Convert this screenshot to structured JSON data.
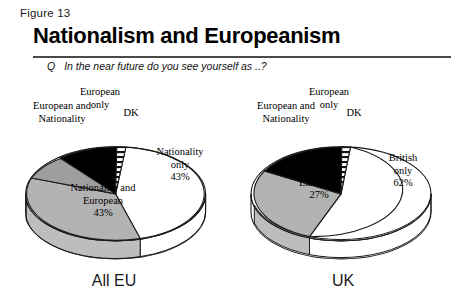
{
  "figure": {
    "label": "Figure 13",
    "title": "Nationalism and Europeanism"
  },
  "question": {
    "marker": "Q",
    "text": "In the near future do you see yourself as ..?"
  },
  "colors": {
    "slice_white": "#ffffff",
    "slice_grey": "#b3b3b3",
    "slice_black": "#000000",
    "slice_hatched": "#ffffff",
    "outline": "#1a1a1a",
    "rule": "#4a4a4a",
    "text": "#000000"
  },
  "charts": [
    {
      "id": "alleu",
      "caption": "All EU",
      "callouts": {
        "european_only": "European\nonly",
        "european_and_nationality": "European and\nNationality",
        "dk": "DK"
      },
      "slices": [
        {
          "key": "nationality_only",
          "label": "Nationality\nonly",
          "value": 43,
          "pct_text": "43%",
          "fill": "white",
          "inside_label": true
        },
        {
          "key": "nationality_and_european",
          "label": "Nationality and\nEuropean",
          "value": 43,
          "pct_text": "43%",
          "fill": "grey",
          "inside_label": true
        },
        {
          "key": "european_and_nationality",
          "label": "European and Nationality",
          "value": 7,
          "pct_text": "7%",
          "fill": "grey-dark",
          "inside_label": false
        },
        {
          "key": "european_only",
          "label": "European only",
          "value": 4,
          "pct_text": "4%",
          "fill": "black",
          "inside_label": false
        },
        {
          "key": "dk",
          "label": "DK",
          "value": 3,
          "pct_text": "",
          "fill": "hatched",
          "inside_label": false
        }
      ]
    },
    {
      "id": "uk",
      "caption": "UK",
      "callouts": {
        "european_only": "European\nonly",
        "european_and_nationality": "European and\nNationality",
        "dk": "DK"
      },
      "slices": [
        {
          "key": "british_only",
          "label": "British\nonly",
          "value": 62,
          "pct_text": "62%",
          "fill": "white",
          "inside_label": true
        },
        {
          "key": "british_and_european",
          "label": "British and\nEuropean",
          "value": 27,
          "pct_text": "27%",
          "fill": "grey",
          "inside_label": true
        },
        {
          "key": "european_and_nationality",
          "label": "European and Nationality",
          "value": 4,
          "pct_text": "4%",
          "fill": "black",
          "inside_label": false
        },
        {
          "key": "european_only",
          "label": "European only",
          "value": 5,
          "pct_text": "5%",
          "fill": "black",
          "inside_label": false
        },
        {
          "key": "dk",
          "label": "DK",
          "value": 2,
          "pct_text": "",
          "fill": "hatched",
          "inside_label": false
        }
      ]
    }
  ],
  "chart_data": {
    "type": "pie",
    "title": "Nationalism and Europeanism",
    "subtitle": "Q  In the near future do you see yourself as ..?",
    "figure_number": "Figure 13",
    "unit": "percent",
    "legend": "none",
    "grid": false,
    "panels": [
      {
        "name": "All EU",
        "categories": [
          "Nationality only",
          "Nationality and European",
          "European and Nationality",
          "European only",
          "DK"
        ],
        "values": [
          43,
          43,
          7,
          4,
          3
        ],
        "labels": [
          "43%",
          "43%",
          "7%",
          "4%",
          ""
        ]
      },
      {
        "name": "UK",
        "categories": [
          "British only",
          "British and European",
          "European and Nationality",
          "European only",
          "DK"
        ],
        "values": [
          62,
          27,
          4,
          5,
          2
        ],
        "labels": [
          "62%",
          "27%",
          "4%",
          "5%",
          ""
        ]
      }
    ]
  }
}
